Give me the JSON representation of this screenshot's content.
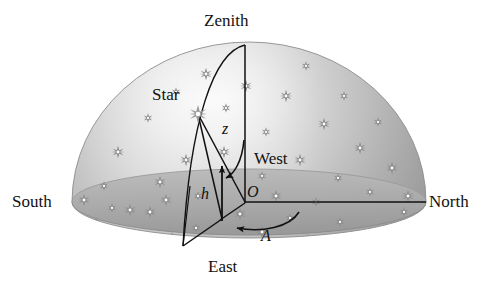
{
  "figure": {
    "type": "diagram"
  },
  "labels": {
    "zenith": "Zenith",
    "star": "Star",
    "south": "South",
    "north": "North",
    "east": "East",
    "west": "West",
    "zenith_distance": "z",
    "altitude": "h",
    "origin": "O",
    "azimuth": "A"
  },
  "colors": {
    "ink": "#111111",
    "dome_light": "#f2f2f2",
    "dome_mid": "#c9c9c9",
    "dome_dark": "#9c9c9c",
    "ground_light": "#b5b5b5",
    "ground_dark": "#8f8f8f",
    "star_glyph": "#8a8a8a",
    "background": "#ffffff"
  },
  "geometry": {
    "dome_center_x": 249,
    "dome_center_y": 202,
    "dome_radius_x": 177,
    "dome_radius_y": 160,
    "horizon_ry": 33,
    "origin": {
      "x": 245,
      "y": 202
    },
    "zenith_point": {
      "x": 245,
      "y": 45
    },
    "star_point": {
      "x": 198,
      "y": 114
    },
    "star_foot": {
      "x": 222,
      "y": 218
    },
    "arc_horizon_point": {
      "x": 183,
      "y": 246
    },
    "north_end": {
      "x": 426,
      "y": 202
    },
    "south_end": {
      "x": 72,
      "y": 202
    }
  },
  "elements": {
    "zenith_axis": "vertical line from Zenith to O",
    "vertical_circle": "great-circle arc Zenith -> Star -> horizon",
    "zenith_distance_arc": "curved arrow from zenith axis to star line",
    "altitude_arrow": "vertical arrow h from star foot upward",
    "azimuth_arc": "curved arrow A from north meridian to star foot",
    "star_marker": "8-point starburst at star position"
  },
  "stars": {
    "count": 44,
    "glyph": "starburst-8"
  }
}
